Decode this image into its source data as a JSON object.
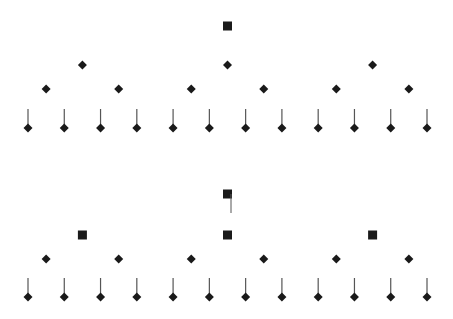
{
  "diagram": {
    "colors": {
      "node": "#1a1a1a",
      "stem": "#555555",
      "background": "#ffffff"
    },
    "trees": [
      {
        "name": "upper-tree",
        "levels": [
          {
            "shape": "square",
            "count": 1
          },
          {
            "shape": "diamond",
            "count": 3
          },
          {
            "shape": "diamond",
            "count": 6
          },
          {
            "shape": "diamond-with-stem",
            "count": 12
          }
        ],
        "root_has_side_line": false
      },
      {
        "name": "lower-tree",
        "levels": [
          {
            "shape": "square",
            "count": 1
          },
          {
            "shape": "square",
            "count": 3
          },
          {
            "shape": "diamond",
            "count": 6
          },
          {
            "shape": "diamond-with-stem",
            "count": 12
          }
        ],
        "root_has_side_line": true
      }
    ]
  }
}
